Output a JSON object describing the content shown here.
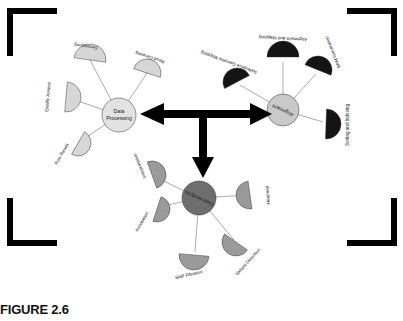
{
  "figure": {
    "caption": "FIGURE 2.6",
    "background_color": "#ffffff",
    "ink_color": "#000000"
  },
  "colors": {
    "data_processing_fill": "#d6d6d6",
    "data_processing_hub": "#e2e2e2",
    "alignment_fill": "#141414",
    "alignment_hub": "#c9c9c9",
    "data_analysis_fill": "#9a9a9a",
    "data_analysis_hub": "#6e6e6e",
    "spoke_line": "#555555",
    "outline": "#333333"
  },
  "clusters": [
    {
      "id": "data-processing",
      "hub_label": "Data Processing",
      "hub_label_lines": [
        "Data",
        "Processing"
      ],
      "hub_fill": "#e2e2e2",
      "leaf_fill": "#d6d6d6",
      "text_rotated": true,
      "nodes": [
        {
          "label": "Genotyping",
          "angle": -100
        },
        {
          "label": "Read Cleaning",
          "angle": -45
        },
        {
          "label": "Quality Assess",
          "angle": -160
        },
        {
          "label": "Raw Reads",
          "angle": 150
        }
      ]
    },
    {
      "id": "alignment",
      "hub_label": "Alignment",
      "hub_label_lines": [
        "Alignment"
      ],
      "hub_fill": "#c9c9c9",
      "leaf_fill": "#141414",
      "text_rotated": true,
      "nodes": [
        {
          "label": "Alignment and Mapping",
          "angle": -90
        },
        {
          "label": "BAM Generation",
          "angle": -40
        },
        {
          "label": "Reference Genome Mapping",
          "angle": -150
        },
        {
          "label": "Sorting and Indexing",
          "angle": 10
        }
      ]
    },
    {
      "id": "data-analysis",
      "hub_label": "Data Analysis",
      "hub_label_lines": [
        "Data Analysis"
      ],
      "hub_fill": "#6e6e6e",
      "leaf_fill": "#9a9a9a",
      "text_rotated": true,
      "nodes": [
        {
          "label": "Interpretation",
          "angle": -148
        },
        {
          "label": "Annotation",
          "angle": 168
        },
        {
          "label": "SNP Filtration",
          "angle": 100
        },
        {
          "label": "Variant Detection",
          "angle": 55
        },
        {
          "label": "Heatmap",
          "angle": 0
        }
      ]
    }
  ],
  "arrows": [
    {
      "id": "left-arrow",
      "direction": "left",
      "from": "alignment",
      "to": "data-processing"
    },
    {
      "id": "right-arrow",
      "direction": "right",
      "from": "data-processing",
      "to": "alignment"
    },
    {
      "id": "down-arrow",
      "direction": "down",
      "from": "junction",
      "to": "data-analysis"
    }
  ]
}
